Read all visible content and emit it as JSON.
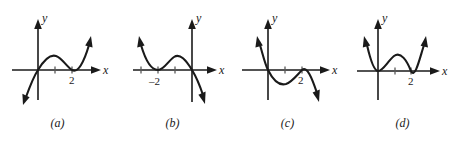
{
  "figure": {
    "background": "#ffffff",
    "ink": "#1a1a1a",
    "panels": [
      {
        "caption": "(a)",
        "x_axis_label": "x",
        "y_axis_label": "y",
        "tick_label": "2",
        "tick_label_value": 2,
        "description": "cubic-like curve rising from lower left through origin, local maximum, tangent touch at x=2, then rising to upper right",
        "left": 0
      },
      {
        "caption": "(b)",
        "x_axis_label": "x",
        "y_axis_label": "y",
        "tick_label": "–2",
        "tick_label_value": -2,
        "description": "curve descending from upper left, tangent touch at x=-2, local maximum, then falling through origin to lower right",
        "left": 115
      },
      {
        "caption": "(c)",
        "x_axis_label": "x",
        "y_axis_label": "y",
        "tick_label": "2",
        "tick_label_value": 2,
        "description": "curve falling from upper left through origin, local minimum below axis, tangent touch at x=2, then falling to lower right",
        "left": 230
      },
      {
        "caption": "(d)",
        "x_axis_label": "x",
        "y_axis_label": "y",
        "tick_label": "2",
        "tick_label_value": 2,
        "description": "W-shaped quartic touching x-axis at 0 and 2 with a local maximum between, arms rising on both sides",
        "left": 345
      }
    ]
  }
}
